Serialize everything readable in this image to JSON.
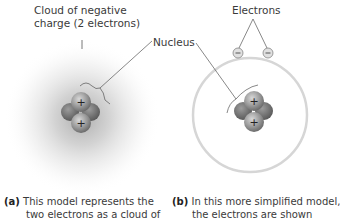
{
  "labels": {
    "cloud_line1": "Cloud of negative",
    "cloud_line2": "charge (2 electrons)",
    "nucleus": "Nucleus",
    "electrons": "Electrons"
  },
  "captions": {
    "a": {
      "marker": "(a)",
      "line1": "This model represents the",
      "line2": "two electrons as a cloud of",
      "line3": "negative charge, a result of"
    },
    "b": {
      "marker": "(b)",
      "line1": "In this more simplified model,",
      "line2": "the electrons are shown",
      "line3": "as two small yellow spheres"
    }
  },
  "symbols": {
    "proton": "+",
    "electron": "−"
  }
}
